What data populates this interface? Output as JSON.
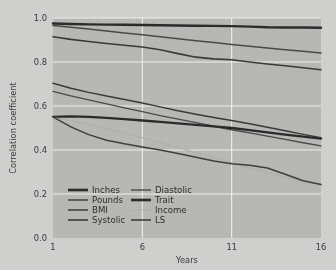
{
  "chart_data": {
    "type": "line",
    "title": "",
    "xlabel": "Years",
    "ylabel": "Correlation coefficient",
    "xlim": [
      1,
      16
    ],
    "ylim": [
      0.0,
      1.0
    ],
    "xticks": [
      1,
      6,
      11,
      16
    ],
    "xtick_labels": [
      "1",
      "6",
      "11",
      "16"
    ],
    "yticks": [
      0.0,
      0.2,
      0.4,
      0.6,
      0.8,
      1.0
    ],
    "ytick_labels": [
      "0.0",
      "0.2",
      "0.4",
      "0.6",
      "0.8",
      "1.0"
    ],
    "grid": true,
    "grid_color": "#f2f2ef",
    "plot_background": "#b9b9b6",
    "figure_background": "#d2d2d0",
    "legend_position": "lower-left-inside",
    "legend_columns": 2,
    "x": [
      1,
      2,
      3,
      4,
      5,
      6,
      7,
      8,
      9,
      10,
      11,
      12,
      13,
      14,
      15,
      16
    ],
    "series": [
      {
        "name": "Inches",
        "color": "#2b2b2b",
        "width": 2.4,
        "values": [
          0.975,
          0.973,
          0.971,
          0.97,
          0.969,
          0.968,
          0.967,
          0.966,
          0.965,
          0.964,
          0.963,
          0.961,
          0.958,
          0.957,
          0.957,
          0.956
        ]
      },
      {
        "name": "Pounds",
        "color": "#4a4a4a",
        "width": 1.5,
        "values": [
          0.966,
          0.958,
          0.95,
          0.941,
          0.932,
          0.924,
          0.915,
          0.906,
          0.897,
          0.889,
          0.88,
          0.872,
          0.864,
          0.856,
          0.849,
          0.841
        ]
      },
      {
        "name": "BMI",
        "color": "#3a3a3a",
        "width": 1.6,
        "values": [
          0.915,
          0.903,
          0.893,
          0.884,
          0.876,
          0.868,
          0.856,
          0.838,
          0.822,
          0.814,
          0.81,
          0.8,
          0.791,
          0.783,
          0.774,
          0.765
        ]
      },
      {
        "name": "Systolic",
        "color": "#3a3a3a",
        "width": 1.5,
        "values": [
          0.703,
          0.681,
          0.662,
          0.645,
          0.63,
          0.614,
          0.596,
          0.578,
          0.562,
          0.548,
          0.534,
          0.519,
          0.503,
          0.487,
          0.471,
          0.456
        ]
      },
      {
        "name": "Diastolic",
        "color": "#4a4a4a",
        "width": 1.3,
        "values": [
          0.666,
          0.646,
          0.628,
          0.61,
          0.592,
          0.574,
          0.556,
          0.54,
          0.524,
          0.508,
          0.492,
          0.478,
          0.463,
          0.448,
          0.433,
          0.419
        ]
      },
      {
        "name": "Trait",
        "color": "#2b2b2b",
        "width": 2.3,
        "values": [
          0.551,
          0.553,
          0.551,
          0.546,
          0.54,
          0.534,
          0.528,
          0.521,
          0.514,
          0.507,
          0.5,
          0.49,
          0.48,
          0.47,
          0.461,
          0.452
        ]
      },
      {
        "name": "Income",
        "color": "#b0b0ad",
        "width": 1.1,
        "values": [
          0.548,
          0.533,
          0.516,
          0.497,
          0.477,
          0.456,
          0.434,
          0.411,
          0.388,
          0.365,
          0.342,
          0.32,
          0.298,
          0.277,
          0.258,
          0.244
        ]
      },
      {
        "name": "LS",
        "color": "#3f3f3f",
        "width": 1.5,
        "values": [
          0.551,
          0.505,
          0.47,
          0.444,
          0.428,
          0.414,
          0.4,
          0.384,
          0.367,
          0.35,
          0.337,
          0.331,
          0.318,
          0.29,
          0.26,
          0.243
        ]
      }
    ],
    "legend": [
      {
        "label": "Inches",
        "color": "#2b2b2b",
        "width": 2.6
      },
      {
        "label": "Diastolic",
        "color": "#4a4a4a",
        "width": 1.4
      },
      {
        "label": "Pounds",
        "color": "#4a4a4a",
        "width": 1.6
      },
      {
        "label": "Trait",
        "color": "#2b2b2b",
        "width": 2.6
      },
      {
        "label": "BMI",
        "color": "#3a3a3a",
        "width": 1.5
      },
      {
        "label": "Income",
        "color": "#b0b0ad",
        "width": 1.1
      },
      {
        "label": "Systolic",
        "color": "#3a3a3a",
        "width": 1.6
      },
      {
        "label": "LS",
        "color": "#3f3f3f",
        "width": 1.6
      }
    ]
  }
}
